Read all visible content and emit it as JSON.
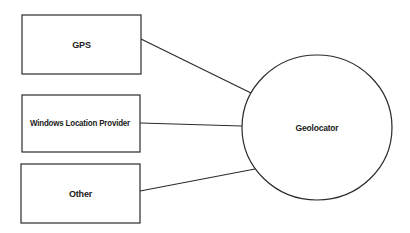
{
  "diagram": {
    "type": "block-diagram",
    "sources": [
      {
        "id": "gps",
        "label": "GPS"
      },
      {
        "id": "windows-location-provider",
        "label": "Windows Location Provider"
      },
      {
        "id": "other",
        "label": "Other"
      }
    ],
    "target": {
      "id": "geolocator",
      "label": "Geolocator"
    },
    "edges": [
      {
        "from": "gps",
        "to": "geolocator"
      },
      {
        "from": "windows-location-provider",
        "to": "geolocator"
      },
      {
        "from": "other",
        "to": "geolocator"
      }
    ],
    "colors": {
      "stroke": "#2b2b2b",
      "fill": "#ffffff",
      "text": "#1a1a1a"
    }
  }
}
